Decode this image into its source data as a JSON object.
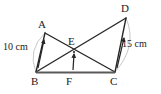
{
  "figure": {
    "type": "geometry-diagram",
    "canvas": {
      "width": 161,
      "height": 94,
      "background": "#ffffff"
    },
    "stroke_color": "#262626",
    "arc_color": "#b9b9b9",
    "points": [
      {
        "id": "A",
        "label": "A",
        "x": 45,
        "y": 33,
        "label_x": 38,
        "label_y": 19
      },
      {
        "id": "B",
        "label": "B",
        "x": 36,
        "y": 72,
        "label_x": 31,
        "label_y": 76
      },
      {
        "id": "C",
        "label": "C",
        "x": 115,
        "y": 72,
        "label_x": 110,
        "label_y": 76
      },
      {
        "id": "D",
        "label": "D",
        "x": 126,
        "y": 18,
        "label_x": 121,
        "label_y": 3
      },
      {
        "id": "E",
        "label": "E",
        "x": 74,
        "y": 52,
        "label_x": 68,
        "label_y": 36
      },
      {
        "id": "F",
        "label": "F",
        "x": 72,
        "y": 72,
        "label_x": 66,
        "label_y": 76
      }
    ],
    "segments": [
      {
        "name": "AB",
        "from": "A",
        "to": "B"
      },
      {
        "name": "AC",
        "from": "A",
        "to": "C"
      },
      {
        "name": "BD",
        "from": "B",
        "to": "D"
      },
      {
        "name": "DC",
        "from": "D",
        "to": "C"
      },
      {
        "name": "BC",
        "from": "B",
        "to": "C"
      }
    ],
    "arcs": [
      {
        "name": "arc-AB",
        "from": "A",
        "to": "B",
        "bulge": "left"
      },
      {
        "name": "arc-DC",
        "from": "D",
        "to": "C",
        "bulge": "right"
      }
    ],
    "measurements": [
      {
        "id": "measure-AB",
        "text": "10 cm",
        "label_x": 3,
        "label_y": 42,
        "arrow_from_x": 38,
        "arrow_from_y": 68,
        "arrow_to_x": 44,
        "arrow_to_y": 40
      },
      {
        "id": "measure-DC",
        "text": "15 cm",
        "label_x": 122,
        "label_y": 39,
        "arrow_from_x": 117,
        "arrow_from_y": 68,
        "arrow_to_x": 124,
        "arrow_to_y": 38
      }
    ],
    "height_arrow": {
      "id": "arrow-FE",
      "from_x": 73,
      "from_y": 70,
      "to_x": 74,
      "to_y": 54
    }
  }
}
